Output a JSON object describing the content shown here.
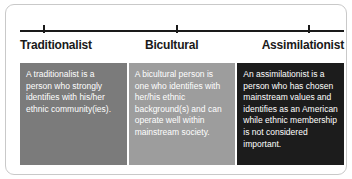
{
  "figure": {
    "scale": {
      "ticks": [
        {
          "name": "tick-traditionalist",
          "position_label": "Traditionalist"
        },
        {
          "name": "tick-bicultural",
          "position_label": "Bicultural"
        },
        {
          "name": "tick-assimilationist",
          "position_label": "Assimilationist"
        }
      ]
    },
    "labels": {
      "left": "Traditionalist",
      "middle": "Bicultural",
      "right": "Assimilationist"
    },
    "panels": [
      {
        "id": "traditionalist",
        "text": "A traditionalist is a person who strongly identifies with his/her ethnic community(ies).",
        "background_color": "#7b7b7b",
        "text_color": "#ffffff"
      },
      {
        "id": "bicultural",
        "text": "A bicultural person is one who identifies with her/his ethnic background(s) and can operate well within mainstream society.",
        "background_color": "#9d9d9d",
        "text_color": "#ffffff"
      },
      {
        "id": "assimilationist",
        "text": "An assimilationist is a person who has chosen mainstream values and identifies as an American while ethnic membership is not considered important.",
        "background_color": "#1c1c1c",
        "text_color": "#ffffff"
      }
    ]
  }
}
